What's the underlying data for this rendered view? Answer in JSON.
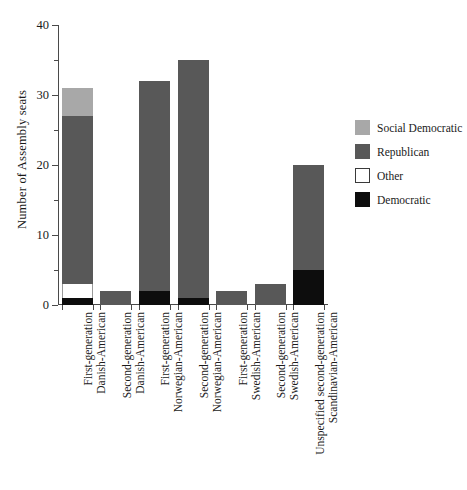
{
  "chart_data": {
    "type": "bar",
    "subtype": "stacked-vertical",
    "title": "",
    "xlabel": "",
    "ylabel": "Number of Assembly seats",
    "ylim": [
      0,
      40
    ],
    "ytick_values": [
      0,
      10,
      20,
      30,
      40
    ],
    "ytick_labels": [
      "0",
      "10",
      "20",
      "30",
      "40"
    ],
    "yminor_ticks": [
      5,
      15,
      25,
      35
    ],
    "grid": false,
    "legend_position": "right",
    "categories": [
      "First-generation Danish-American",
      "Second-generation Danish-American",
      "First-generation Norwegian-American",
      "Second-generation Norwegian-American",
      "First-generation Swedish-American",
      "Second-generation Swedish-American",
      "Unspecified second-generation Scandinavian-American"
    ],
    "category_lines": [
      [
        "First-generation",
        "Danish-American"
      ],
      [
        "Second-generation",
        "Danish-American"
      ],
      [
        "First-generation",
        "Norwegian-American"
      ],
      [
        "Second-generation",
        "Norwegian-American"
      ],
      [
        "First-generation",
        "Swedish-American"
      ],
      [
        "Second-generation",
        "Swedish-American"
      ],
      [
        "Unspecified second-generation",
        "Scandinavian-American"
      ]
    ],
    "series": [
      {
        "name": "Democratic",
        "color": "#0d0d0d",
        "values": [
          1,
          0,
          2,
          1,
          0,
          0,
          5
        ]
      },
      {
        "name": "Other",
        "color": "#ffffff",
        "values": [
          2,
          0,
          0,
          0,
          0,
          0,
          0
        ]
      },
      {
        "name": "Republican",
        "color": "#585858",
        "values": [
          24,
          2,
          30,
          34,
          2,
          3,
          15
        ]
      },
      {
        "name": "Social Democratic",
        "color": "#a8a8a8",
        "values": [
          4,
          0,
          0,
          0,
          0,
          0,
          0
        ]
      }
    ],
    "stack_order_bottom_to_top": [
      "Democratic",
      "Other",
      "Republican",
      "Social Democratic"
    ],
    "totals": [
      31,
      2,
      32,
      35,
      2,
      3,
      20
    ]
  },
  "legend": {
    "items": [
      {
        "label": "Social Democratic",
        "color": "#a8a8a8",
        "bordered": false
      },
      {
        "label": "Republican",
        "color": "#585858",
        "bordered": false
      },
      {
        "label": "Other",
        "color": "#ffffff",
        "bordered": true
      },
      {
        "label": "Democratic",
        "color": "#0d0d0d",
        "bordered": false
      }
    ]
  },
  "colors": {
    "axis": "#4a4a4a",
    "text": "#1a1a1a",
    "background": "#ffffff"
  }
}
